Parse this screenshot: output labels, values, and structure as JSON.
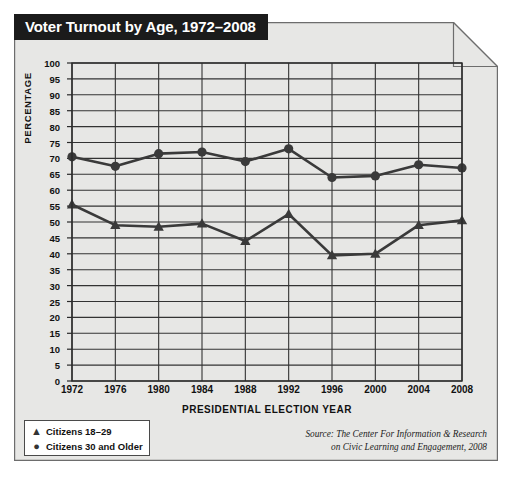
{
  "card": {
    "title": "Voter Turnout by Age, 1972–2008",
    "background_color": "#e7e7e5",
    "banner_color": "#1b1b1b",
    "banner_text_color": "#ffffff"
  },
  "legend": {
    "items": [
      {
        "marker": "triangle-marker",
        "glyph": "▲",
        "label": "Citizens 18–29"
      },
      {
        "marker": "circle-marker",
        "glyph": "●",
        "label": "Citizens 30 and Older"
      }
    ]
  },
  "source": {
    "line1": "Source: The Center For Information & Research",
    "line2": "on Civic Learning and Engagement, 2008"
  },
  "chart_data": {
    "type": "line",
    "title": "Voter Turnout by Age, 1972–2008",
    "xlabel": "PRESIDENTIAL ELECTION YEAR",
    "ylabel": "PERCENTAGE",
    "categories": [
      1972,
      1976,
      1980,
      1984,
      1988,
      1992,
      1996,
      2000,
      2004,
      2008
    ],
    "x": [
      1972,
      1976,
      1980,
      1984,
      1988,
      1992,
      1996,
      2000,
      2004,
      2008
    ],
    "xlim": [
      1972,
      2008
    ],
    "ylim": [
      0,
      100
    ],
    "ytick_step": 5,
    "yticks": [
      0,
      5,
      10,
      15,
      20,
      25,
      30,
      35,
      40,
      45,
      50,
      55,
      60,
      65,
      70,
      75,
      80,
      85,
      90,
      95,
      100
    ],
    "xticks": [
      1972,
      1976,
      1980,
      1984,
      1988,
      1992,
      1996,
      2000,
      2004,
      2008
    ],
    "grid": true,
    "legend_position": "below-left",
    "series": [
      {
        "name": "Citizens 30 and Older",
        "marker": "circle",
        "color": "#3a3a3a",
        "values": [
          70.5,
          67.5,
          71.5,
          72,
          69,
          73,
          64,
          64.5,
          68,
          67
        ]
      },
      {
        "name": "Citizens 18–29",
        "marker": "triangle",
        "color": "#3a3a3a",
        "values": [
          55.5,
          49,
          48.5,
          49.5,
          44,
          52.5,
          39.5,
          40,
          49,
          50.5
        ]
      }
    ]
  }
}
